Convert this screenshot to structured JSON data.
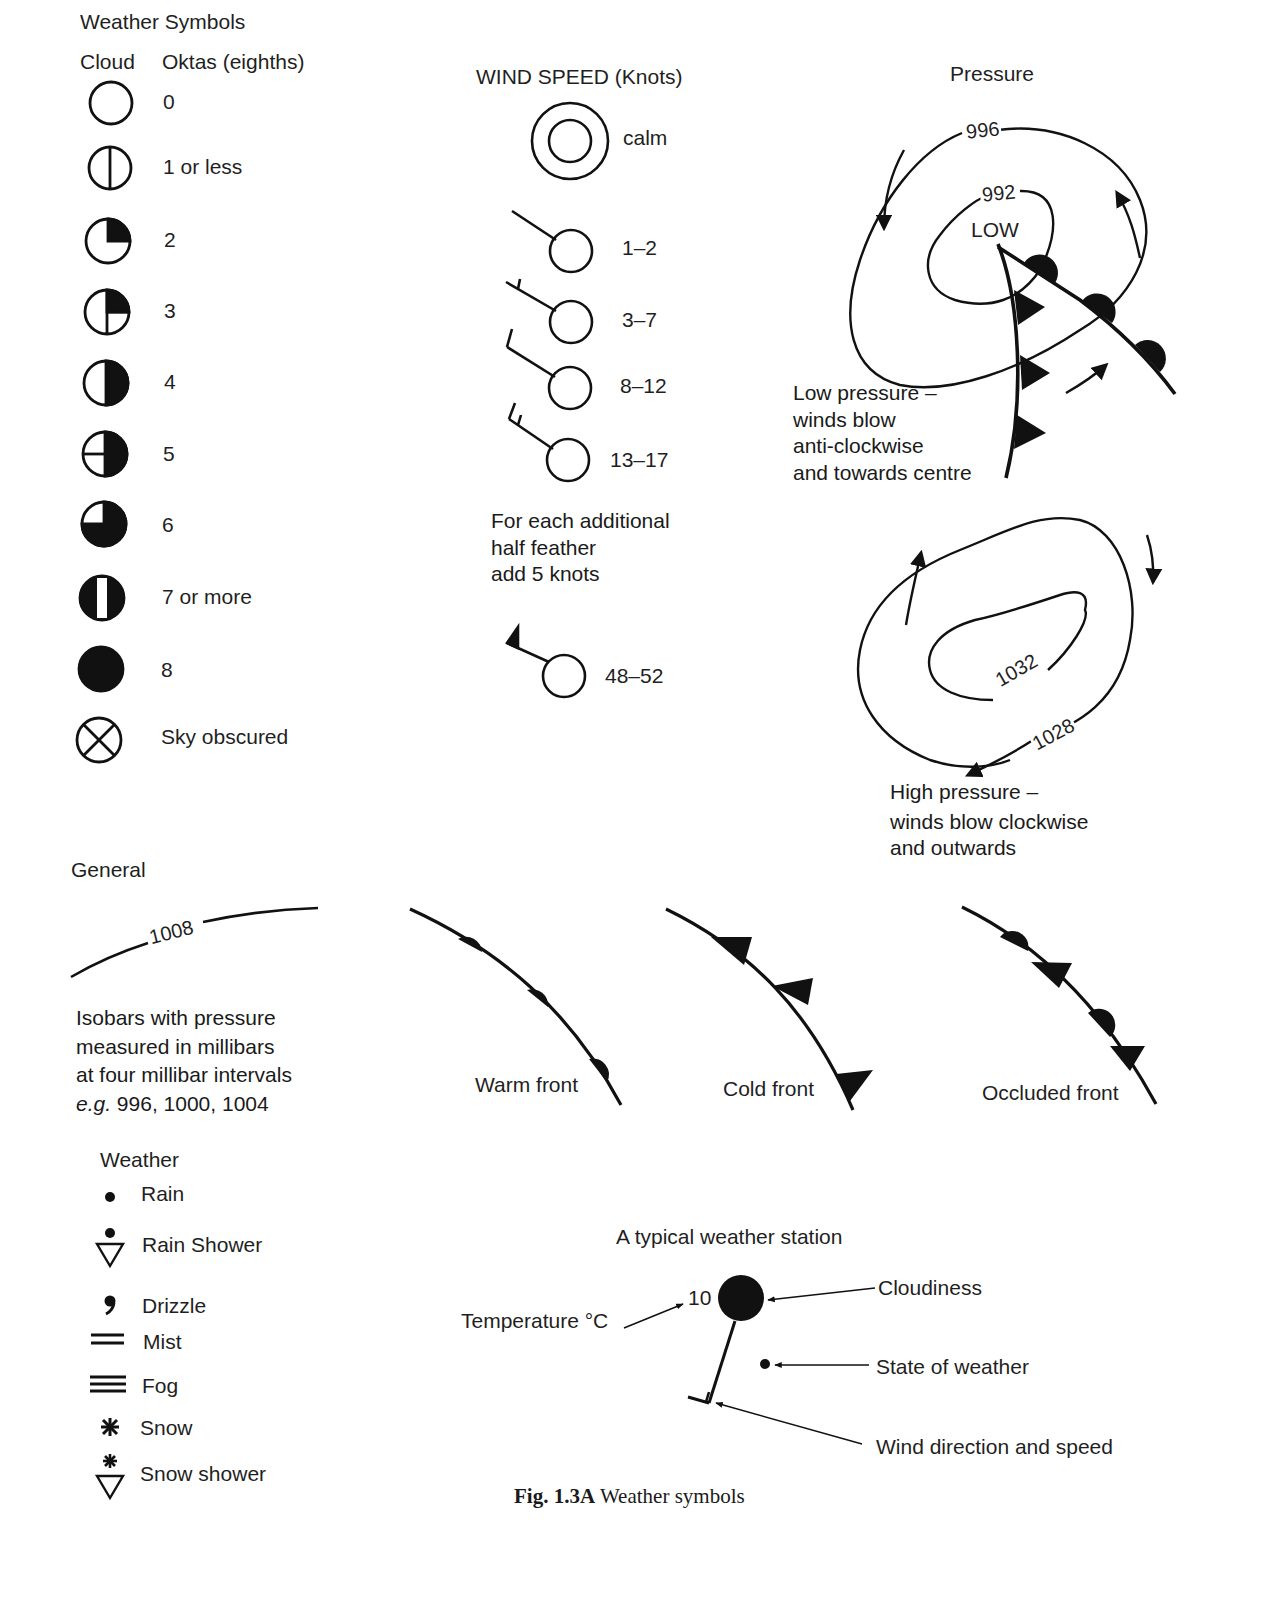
{
  "title": "Weather Symbols",
  "cloud": {
    "header_cloud": "Cloud",
    "header_oktas": "Oktas (eighths)",
    "items": [
      {
        "symbol": "circle-empty-icon",
        "label": "0"
      },
      {
        "symbol": "circle-vertical-line-icon",
        "label": "1 or less"
      },
      {
        "symbol": "circle-quarter-filled-icon",
        "label": "2"
      },
      {
        "symbol": "circle-quarter-filled-cross-icon",
        "label": "3"
      },
      {
        "symbol": "circle-half-filled-icon",
        "label": "4"
      },
      {
        "symbol": "circle-half-filled-horizontal-icon",
        "label": "5"
      },
      {
        "symbol": "circle-three-quarter-filled-icon",
        "label": "6"
      },
      {
        "symbol": "circle-filled-white-bar-icon",
        "label": "7 or more"
      },
      {
        "symbol": "circle-filled-icon",
        "label": "8"
      },
      {
        "symbol": "circle-x-icon",
        "label": "Sky obscured"
      }
    ]
  },
  "wind": {
    "title": "WIND SPEED (Knots)",
    "items": [
      {
        "symbol": "double-circle-icon",
        "label": "calm"
      },
      {
        "symbol": "wind-barb-no-feather-icon",
        "label": "1–2"
      },
      {
        "symbol": "wind-barb-half-feather-icon",
        "label": "3–7"
      },
      {
        "symbol": "wind-barb-one-feather-icon",
        "label": "8–12"
      },
      {
        "symbol": "wind-barb-one-and-half-feather-icon",
        "label": "13–17"
      }
    ],
    "note": [
      "For each additional",
      "half feather",
      "add 5 knots"
    ],
    "pennant": {
      "symbol": "wind-barb-pennant-icon",
      "label": "48–52"
    }
  },
  "pressure": {
    "title": "Pressure",
    "low": {
      "isobars": [
        "996",
        "992"
      ],
      "centre_label": "LOW",
      "description": [
        "Low pressure –",
        "winds blow",
        "anti-clockwise",
        "and towards centre"
      ]
    },
    "high": {
      "isobars": [
        "1032",
        "1028"
      ],
      "description": [
        "High pressure –",
        "winds blow clockwise",
        "and outwards"
      ]
    }
  },
  "general": {
    "title": "General",
    "isobar_value": "1008",
    "description": [
      "Isobars with pressure",
      "measured in millibars",
      "at four millibar intervals"
    ],
    "example_prefix": "e.g.",
    "example_values": " 996, 1000, 1004"
  },
  "fronts": [
    {
      "symbol": "warm-front-icon",
      "label": "Warm front"
    },
    {
      "symbol": "cold-front-icon",
      "label": "Cold front"
    },
    {
      "symbol": "occluded-front-icon",
      "label": "Occluded front"
    }
  ],
  "weather": {
    "title": "Weather",
    "items": [
      {
        "symbol": "rain-dot-icon",
        "label": "Rain"
      },
      {
        "symbol": "rain-shower-icon",
        "label": "Rain Shower"
      },
      {
        "symbol": "drizzle-comma-icon",
        "label": "Drizzle"
      },
      {
        "symbol": "mist-lines-icon",
        "label": "Mist"
      },
      {
        "symbol": "fog-lines-icon",
        "label": "Fog"
      },
      {
        "symbol": "snow-asterisk-icon",
        "label": "Snow"
      },
      {
        "symbol": "snow-shower-icon",
        "label": "Snow shower"
      }
    ]
  },
  "station": {
    "title": "A typical weather station",
    "temperature_value": "10",
    "labels": {
      "temperature": "Temperature °C",
      "cloudiness": "Cloudiness",
      "state_of_weather": "State of weather",
      "wind": "Wind direction and speed"
    }
  },
  "caption": {
    "figure_number": "Fig. 1.3A",
    "text": " Weather symbols"
  }
}
